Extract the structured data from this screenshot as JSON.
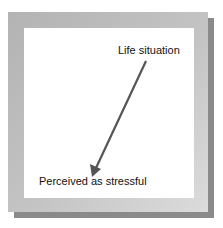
{
  "diagram": {
    "nodes": [
      {
        "id": "life-situation",
        "label": "Life situation"
      },
      {
        "id": "perceived-stressful",
        "label": "Perceived as stressful"
      }
    ],
    "edges": [
      {
        "from": "life-situation",
        "to": "perceived-stressful"
      }
    ],
    "colors": {
      "frame": "#b8b8b8",
      "shadow": "#8a8a8a",
      "arrow": "#555555"
    }
  }
}
